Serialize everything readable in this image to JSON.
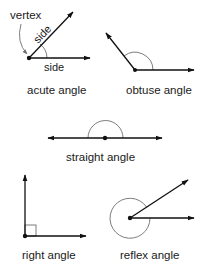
{
  "diagram": {
    "colors": {
      "line": "#111111",
      "arc": "#6e6e6e",
      "text": "#1a1a1a",
      "background": "#ffffff"
    },
    "acute": {
      "label": "acute angle",
      "vertex_label": "vertex",
      "side_label_1": "side",
      "side_label_2": "side"
    },
    "obtuse": {
      "label": "obtuse angle"
    },
    "straight": {
      "label": "straight angle"
    },
    "right": {
      "label": "right angle"
    },
    "reflex": {
      "label": "reflex angle"
    }
  }
}
